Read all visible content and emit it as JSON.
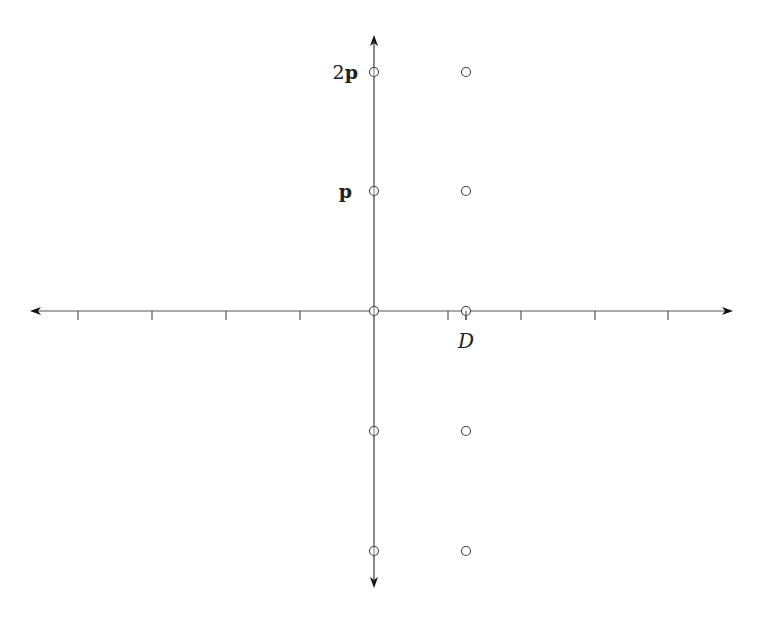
{
  "figure": {
    "colors": {
      "axis": "#555555",
      "point": "#444444",
      "text": "#222222",
      "background": "#ffffff"
    },
    "origin": {
      "x": 374,
      "y": 311
    },
    "x_axis": {
      "from": 30,
      "to": 733,
      "ticks": [
        78,
        152,
        226,
        300,
        448,
        521,
        595,
        668,
        466
      ]
    },
    "y_axis": {
      "from": 35,
      "to": 588
    },
    "points": [
      {
        "x": 374,
        "y": 72
      },
      {
        "x": 466,
        "y": 72
      },
      {
        "x": 374,
        "y": 191
      },
      {
        "x": 466,
        "y": 191
      },
      {
        "x": 374,
        "y": 311
      },
      {
        "x": 466,
        "y": 311
      },
      {
        "x": 374,
        "y": 431
      },
      {
        "x": 466,
        "y": 431
      },
      {
        "x": 374,
        "y": 551
      },
      {
        "x": 466,
        "y": 551
      }
    ],
    "labels": {
      "two_p": {
        "prefix": "2",
        "bold": "p"
      },
      "p": {
        "bold": "p"
      },
      "D": "D"
    }
  }
}
